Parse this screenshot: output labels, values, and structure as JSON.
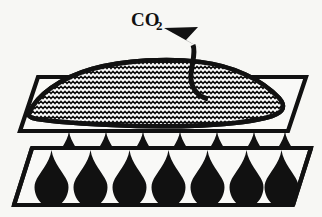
{
  "figure": {
    "background_color": "#f7f7f4",
    "ink_color": "#111111",
    "paper_color": "#f9f9f7"
  },
  "labels": {
    "co2": {
      "text": "CO",
      "subscript": "2",
      "full": "CO2",
      "x": 131,
      "y": 26
    }
  },
  "arrow": {
    "name": "co2-emission-arrow",
    "description": "curved arrow from inside hatched mass pointing up-left out of the surface",
    "start": [
      210,
      98
    ],
    "end": [
      188,
      40
    ],
    "direction": "up-left"
  },
  "upper_plate": {
    "name": "upper-plate",
    "description": "parallelogram slab supporting the hatched mass",
    "points": "38,77 306,77 288,131 20,131",
    "fill": "#f9f9f7",
    "stroke": "#111111"
  },
  "lower_plate": {
    "name": "lower-plate",
    "description": "parallelogram slab holding droplet rows",
    "points": "32,148 311,148 293,205 14,205",
    "fill": "#f9f9f7",
    "stroke": "#111111"
  },
  "mass": {
    "name": "hatched-mass",
    "description": "lens shaped body with horizontal zigzag wave hatching",
    "fill_pattern": "zigzag-wave-hatch",
    "outline_color": "#111111",
    "hatch_color": "#111111",
    "path": "M 30,112 C 36,96 60,78 92,69 C 125,60 168,58 200,62 C 234,66 262,80 279,98 C 286,106 284,112 272,116 C 240,126 170,128 112,125 C 72,123 44,121 33,118 C 28,116 28,115 30,112 Z"
  },
  "droplets": {
    "name": "droplet-array",
    "shape": "teardrop",
    "color": "#111111",
    "back_row": {
      "name": "droplet-row-back",
      "count": 7,
      "y_top": 131,
      "height": 52,
      "width": 34,
      "x_positions": [
        52,
        89,
        126,
        163,
        200,
        237,
        268
      ]
    },
    "front_row": {
      "name": "droplet-row-front",
      "count": 7,
      "y_top": 150,
      "height": 58,
      "width": 39,
      "x_positions": [
        32,
        71,
        110,
        149,
        188,
        227,
        262
      ]
    }
  }
}
